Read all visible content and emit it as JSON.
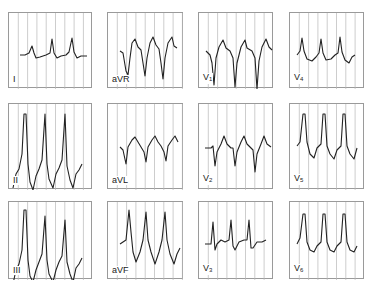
{
  "figure": {
    "title": "",
    "grid_color": "#b8b8b8",
    "frame_color": "#9a9a9a",
    "trace_color": "#222222",
    "panels": [
      {
        "id": "I",
        "label": "I",
        "sub": "",
        "x": 8,
        "y": 12,
        "w": 84,
        "h": 76
      },
      {
        "id": "aVR",
        "label": "aVR",
        "sub": "",
        "x": 107,
        "y": 12,
        "w": 76,
        "h": 76
      },
      {
        "id": "V1",
        "label": "V",
        "sub": "1",
        "x": 198,
        "y": 12,
        "w": 75,
        "h": 76
      },
      {
        "id": "V4",
        "label": "V",
        "sub": "4",
        "x": 289,
        "y": 12,
        "w": 75,
        "h": 76
      },
      {
        "id": "II",
        "label": "II",
        "sub": "",
        "x": 8,
        "y": 103,
        "w": 84,
        "h": 86
      },
      {
        "id": "aVL",
        "label": "aVL",
        "sub": "",
        "x": 107,
        "y": 103,
        "w": 76,
        "h": 86
      },
      {
        "id": "V2",
        "label": "V",
        "sub": "2",
        "x": 198,
        "y": 103,
        "w": 75,
        "h": 86
      },
      {
        "id": "V5",
        "label": "V",
        "sub": "5",
        "x": 289,
        "y": 103,
        "w": 75,
        "h": 86
      },
      {
        "id": "III",
        "label": "III",
        "sub": "",
        "x": 8,
        "y": 201,
        "w": 84,
        "h": 78
      },
      {
        "id": "aVF",
        "label": "aVF",
        "sub": "",
        "x": 107,
        "y": 201,
        "w": 76,
        "h": 78
      },
      {
        "id": "V3",
        "label": "V",
        "sub": "3",
        "x": 198,
        "y": 201,
        "w": 75,
        "h": 78
      },
      {
        "id": "V6",
        "label": "V",
        "sub": "6",
        "x": 289,
        "y": 201,
        "w": 75,
        "h": 78
      }
    ],
    "traces": {
      "I": "M11,42 L16,42 L20,40 L23,33 L25,40 L27,45 L31,44 L37,42 L41,40 L43,26 L45,40 L48,45 L52,43 L57,42 L60,39 L63,25 L65,39 L68,45 L72,43 L78,43",
      "aVR": "M12,38 L15,40 L18,58 L20,62 L22,45 L24,30 L27,26 L30,34 L33,37 L35,50 L37,63 L39,45 L42,30 L45,24 L48,32 L51,36 L53,50 L55,66 L57,45 L60,30 L64,24 L66,33 L69,35",
      "V1": "M7,38 L11,42 L13,50 L15,72 L17,45 L20,34 L24,27 L27,35 L31,38 L34,45 L36,74 L38,50 L42,34 L46,27 L48,35 L53,38 L56,45 L58,76 L60,48 L63,34 L67,26 L70,34 L73,37",
      "V4": "M7,42 L10,38 L12,25 L14,38 L17,46 L22,48 L26,44 L29,40 L31,26 L33,40 L36,47 L41,46 L45,42 L48,40 L50,24 L52,39 L55,47 L59,50 L62,44 L65,42",
      "II": "M4,84 L7,70 L10,65 L13,50 L15,10 L17,10 L19,60 L21,78 L24,86 L27,72 L30,65 L33,56 L36,10 L38,60 L40,75 L44,84 L47,70 L50,64 L53,56 L56,10 L58,62 L61,76 L64,84 L67,70 L70,66 L73,60",
      "aVL": "M12,43 L15,46 L18,60 L20,43 L24,36 L27,33 L30,38 L33,43 L36,48 L38,58 L40,43 L44,36 L47,32 L50,38 L53,42 L56,48 L58,57 L60,42 L64,36 L67,32 L70,38",
      "V2": "M6,44 L12,44 L14,42 L16,62 L18,48 L22,40 L25,32 L28,40 L32,44 L34,44 L36,62 L38,48 L42,38 L45,32 L48,40 L52,44 L54,46 L56,68 L58,50 L62,40 L65,32 L68,40 L72,43",
      "V5": "M7,42 L10,38 L13,10 L15,10 L17,38 L20,50 L24,54 L27,44 L31,40 L33,10 L35,10 L37,42 L40,50 L44,55 L47,46 L51,42 L53,10 L55,10 L57,42 L60,50 L64,55 L67,44",
      "III": "M4,82 L7,68 L10,62 L13,48 L15,8 L17,8 L19,58 L21,74 L24,80 L27,68 L30,60 L33,52 L36,14 L38,58 L40,72 L44,80 L47,68 L50,60 L53,54 L56,18 L58,60 L61,72 L64,80 L67,66 L70,62 L73,56",
      "aVF": "M12,42 L15,40 L18,38 L21,8 L23,30 L25,50 L28,60 L32,50 L35,38 L38,10 L40,38 L43,50 L47,62 L51,50 L54,38 L57,10 L59,38 L62,52 L66,62 L69,52 L72,46",
      "V3": "M6,42 L12,42 L14,20 L16,48 L18,42 L22,38 L26,40 L30,38 L32,18 L34,44 L36,48 L40,40 L45,38 L48,38 L50,18 L52,46 L54,46 L58,40 L63,40 L67,38",
      "V6": "M7,42 L10,36 L13,12 L15,12 L17,40 L20,48 L24,50 L27,44 L31,40 L33,12 L35,12 L37,40 L40,48 L44,50 L47,44 L51,40 L53,12 L55,12 L57,40 L60,48 L64,50 L67,44"
    }
  }
}
